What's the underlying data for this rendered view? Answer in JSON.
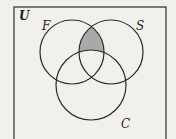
{
  "diagram": {
    "type": "venn",
    "universe": {
      "label": "U",
      "rect": {
        "x": 14,
        "y": 7,
        "width": 152,
        "height": 140
      },
      "stroke": "#3a3a3a",
      "fill": "#f1f0ec"
    },
    "sets": [
      {
        "id": "F",
        "label": "F",
        "cx": 72,
        "cy": 52,
        "r": 32,
        "label_x": 42,
        "label_y": 30
      },
      {
        "id": "S",
        "label": "S",
        "cx": 111,
        "cy": 52,
        "r": 32,
        "label_x": 136,
        "label_y": 30
      },
      {
        "id": "C",
        "label": "C",
        "cx": 91,
        "cy": 85,
        "r": 35,
        "label_x": 121,
        "label_y": 128
      }
    ],
    "shaded_region": {
      "description": "F ∩ S ∩ C' (in F and S but not C)",
      "fill": "#a9a9a9"
    },
    "stroke_color": "#2a2a2a",
    "background": "#f1f0ec"
  }
}
